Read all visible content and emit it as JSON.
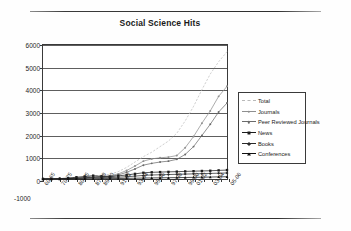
{
  "page": {
    "rule_top": "horizontal-rule",
    "rule_bottom": "horizontal-rule"
  },
  "chart_data": {
    "type": "line",
    "title": "Social Science Hits",
    "xlabel": "",
    "ylabel": "Number of Hits",
    "ylim": [
      -1000,
      6000
    ],
    "yticks": [
      6000,
      5000,
      4000,
      3000,
      2000,
      1000,
      0
    ],
    "ytick_extra": "-1000",
    "grid": true,
    "legend_position": "right",
    "categories": [
      "60-65",
      "70-75",
      "80-85",
      "86-87",
      "87-88",
      "88-89",
      "89-90",
      "90-91",
      "91-92",
      "92-93",
      "93-94",
      "94-95",
      "95-96",
      "96-97",
      "97-98",
      "98-99",
      "99-00",
      "00-01",
      "01-02",
      "02-03",
      "03-04",
      "04-05",
      "05-06"
    ],
    "xtick_labels": [
      "60-65",
      "70-75",
      "80-85",
      "87-88",
      "89-90",
      "91-92",
      "93-94",
      "95-96",
      "97-98",
      "99-00",
      "01-02",
      "03-04",
      "05-06"
    ],
    "series": [
      {
        "name": "Total",
        "color": "#b9b9b9",
        "marker": "none",
        "values": [
          5,
          10,
          20,
          40,
          60,
          90,
          130,
          170,
          210,
          330,
          520,
          760,
          1000,
          1200,
          1450,
          1700,
          2050,
          2600,
          3250,
          4000,
          4700,
          5250,
          5700
        ]
      },
      {
        "name": "Journals",
        "color": "#8f8f8f",
        "marker": "dot",
        "values": [
          3,
          6,
          12,
          25,
          40,
          60,
          90,
          120,
          150,
          230,
          380,
          580,
          800,
          900,
          950,
          980,
          1050,
          1400,
          1900,
          2500,
          3050,
          3700,
          4150
        ]
      },
      {
        "name": "Peer Reviewed Journals",
        "color": "#6b6b6b",
        "marker": "dot",
        "values": [
          2,
          4,
          9,
          18,
          30,
          45,
          70,
          95,
          120,
          180,
          300,
          450,
          620,
          700,
          760,
          800,
          880,
          1100,
          1450,
          1950,
          2450,
          3000,
          3400
        ]
      },
      {
        "name": "News",
        "color": "#1c1c1c",
        "marker": "square",
        "values": [
          2,
          5,
          15,
          40,
          80,
          110,
          150,
          120,
          100,
          140,
          180,
          230,
          280,
          300,
          310,
          320,
          330,
          340,
          350,
          360,
          370,
          385,
          400
        ]
      },
      {
        "name": "Books",
        "color": "#2a2a2a",
        "marker": "diamond",
        "values": [
          1,
          3,
          8,
          20,
          35,
          55,
          80,
          70,
          60,
          80,
          100,
          130,
          160,
          180,
          190,
          200,
          210,
          220,
          230,
          240,
          250,
          260,
          270
        ]
      },
      {
        "name": "Conferences",
        "color": "#111111",
        "marker": "triangle",
        "values": [
          0,
          1,
          2,
          5,
          8,
          12,
          18,
          20,
          18,
          22,
          28,
          35,
          42,
          48,
          52,
          58,
          62,
          68,
          74,
          80,
          88,
          95,
          102
        ]
      }
    ]
  }
}
